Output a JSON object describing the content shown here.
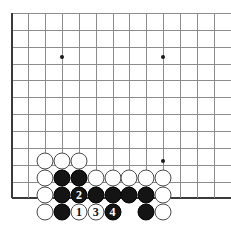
{
  "board": {
    "type": "go-board",
    "title": "Go board diagram — corner sequence",
    "geometry": {
      "origin_x": 11.5,
      "origin_y": 13.0,
      "spacing": 16.85,
      "cols": 13,
      "rows": 12,
      "stone_diameter": 17,
      "left_edge_is_board_edge": true,
      "bottom_edge_is_board_edge": true
    },
    "colors": {
      "background": "#ffffff",
      "grid_line": "#8c8c8c",
      "board_edge": "#3a3a3a",
      "black_stone": "#141414",
      "white_stone": "#ffffff",
      "white_stone_border": "#4a4a4a",
      "star_point": "#1a1a1a",
      "label_on_black": "#ffffff",
      "label_on_white": "#111111"
    },
    "star_points": [
      {
        "col": 3,
        "row": 2.6
      },
      {
        "col": 9,
        "row": 2.6
      },
      {
        "col": 9,
        "row": 8.8
      }
    ],
    "stones": [
      {
        "col": 2,
        "row": 8.8,
        "color": "white",
        "label": ""
      },
      {
        "col": 3,
        "row": 8.8,
        "color": "white",
        "label": ""
      },
      {
        "col": 4,
        "row": 8.8,
        "color": "white",
        "label": ""
      },
      {
        "col": 2,
        "row": 9.8,
        "color": "white",
        "label": ""
      },
      {
        "col": 3,
        "row": 9.8,
        "color": "black",
        "label": ""
      },
      {
        "col": 4,
        "row": 9.8,
        "color": "black",
        "label": ""
      },
      {
        "col": 5,
        "row": 9.8,
        "color": "white",
        "label": ""
      },
      {
        "col": 6,
        "row": 9.8,
        "color": "white",
        "label": ""
      },
      {
        "col": 7,
        "row": 9.8,
        "color": "white",
        "label": ""
      },
      {
        "col": 8,
        "row": 9.8,
        "color": "white",
        "label": ""
      },
      {
        "col": 9,
        "row": 9.8,
        "color": "white",
        "label": ""
      },
      {
        "col": 2,
        "row": 10.8,
        "color": "white",
        "label": ""
      },
      {
        "col": 3,
        "row": 10.8,
        "color": "black",
        "label": ""
      },
      {
        "col": 4,
        "row": 10.8,
        "color": "black",
        "label": "2"
      },
      {
        "col": 5,
        "row": 10.8,
        "color": "black",
        "label": ""
      },
      {
        "col": 6,
        "row": 10.8,
        "color": "black",
        "label": ""
      },
      {
        "col": 7,
        "row": 10.8,
        "color": "black",
        "label": ""
      },
      {
        "col": 8,
        "row": 10.8,
        "color": "black",
        "label": ""
      },
      {
        "col": 9,
        "row": 10.8,
        "color": "white",
        "label": ""
      },
      {
        "col": 2,
        "row": 11.8,
        "color": "white",
        "label": ""
      },
      {
        "col": 3,
        "row": 11.8,
        "color": "black",
        "label": ""
      },
      {
        "col": 4,
        "row": 11.8,
        "color": "white",
        "label": "1"
      },
      {
        "col": 5,
        "row": 11.8,
        "color": "white",
        "label": "3"
      },
      {
        "col": 6,
        "row": 11.8,
        "color": "black",
        "label": "4"
      },
      {
        "col": 8,
        "row": 11.8,
        "color": "black",
        "label": ""
      },
      {
        "col": 9,
        "row": 11.8,
        "color": "white",
        "label": ""
      }
    ],
    "move_labels": [
      {
        "number": "1",
        "color": "white"
      },
      {
        "number": "2",
        "color": "black"
      },
      {
        "number": "3",
        "color": "white"
      },
      {
        "number": "4",
        "color": "black"
      }
    ]
  }
}
